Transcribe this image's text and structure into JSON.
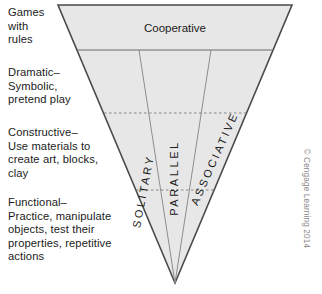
{
  "figure": {
    "credit": "© Cengage Learning 2014",
    "colors": {
      "triangle_fill": "#e7e7e7",
      "triangle_stroke": "#4a4a4a",
      "divider_stroke": "#8d8d8d",
      "dashed_stroke": "#7a7a7a",
      "text": "#1b1b1b",
      "credit_text": "#8a8a8a",
      "background": "#ffffff"
    }
  },
  "left_labels": [
    {
      "id": "games-with-rules",
      "text": "Games\nwith\nrules"
    },
    {
      "id": "dramatic-symbolic",
      "text": "Dramatic–\nSymbolic,\npretend play"
    },
    {
      "id": "constructive",
      "text": "Constructive–\nUse materials to\ncreate art, blocks,\nclay"
    },
    {
      "id": "functional",
      "text": "Functional–\nPractice, manipulate\nobjects, test their\nproperties, repetitive\nactions"
    }
  ],
  "bands": {
    "top": {
      "label": "Cooperative"
    },
    "columns": [
      {
        "id": "solitary",
        "label": "SOLITARY"
      },
      {
        "id": "parallel",
        "label": "PARALLEL"
      },
      {
        "id": "associative",
        "label": "ASSOCIATIVE"
      }
    ]
  }
}
